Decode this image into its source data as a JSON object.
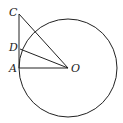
{
  "diagram": {
    "type": "geometry",
    "stroke_color": "#222222",
    "background": "#ffffff",
    "circle": {
      "center": "O",
      "cx": 68,
      "cy": 68,
      "r": 49
    },
    "points": {
      "C": {
        "label": "C",
        "x": 19,
        "y": 14
      },
      "D": {
        "label": "D",
        "x": 20,
        "y": 49
      },
      "A": {
        "label": "A",
        "x": 19,
        "y": 68
      },
      "O": {
        "label": "O",
        "x": 68,
        "y": 68
      }
    },
    "segments": [
      [
        "C",
        "A"
      ],
      [
        "A",
        "O"
      ],
      [
        "D",
        "O"
      ],
      [
        "C",
        "O"
      ]
    ]
  }
}
